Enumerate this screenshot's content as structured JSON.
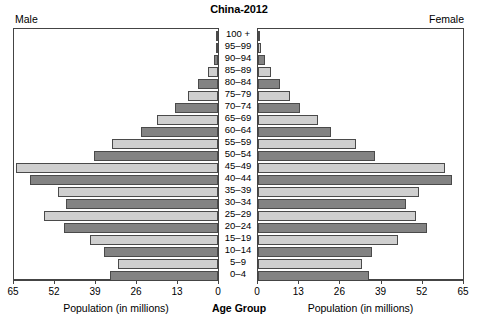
{
  "chart_data": {
    "type": "bar",
    "subtype": "population-pyramid",
    "title": "China-2012",
    "left_panel_label": "Male",
    "right_panel_label": "Female",
    "xlabel_left": "Population (in millions)",
    "xlabel_right": "Population (in millions)",
    "center_axis_label": "Age Group",
    "ylabel": "Age Group",
    "xlim_left": [
      65,
      0
    ],
    "xlim_right": [
      0,
      65
    ],
    "grid": false,
    "legend": "none",
    "left_ticks": [
      "65",
      "52",
      "39",
      "26",
      "13",
      "0"
    ],
    "left_tick_values": [
      65,
      52,
      39,
      26,
      13,
      0
    ],
    "right_ticks": [
      "0",
      "13",
      "26",
      "39",
      "52",
      "65"
    ],
    "right_tick_values": [
      0,
      13,
      26,
      39,
      52,
      65
    ],
    "categories": [
      "100 +",
      "95–99",
      "90–94",
      "85–89",
      "80–84",
      "75–79",
      "70–74",
      "65–69",
      "60–64",
      "55–59",
      "50–54",
      "45–49",
      "40–44",
      "35–39",
      "30–34",
      "25–29",
      "20–24",
      "15–19",
      "10–14",
      "5–9",
      "0–4"
    ],
    "series": [
      {
        "name": "Male",
        "side": "left",
        "values": [
          0.06,
          0.45,
          1.3,
          3.3,
          6.4,
          9.5,
          13.6,
          19.6,
          24.6,
          33.7,
          39.5,
          64.3,
          60.0,
          51.0,
          48.3,
          55.4,
          49.0,
          40.8,
          36.2,
          32.0,
          34.5
        ]
      },
      {
        "name": "Female",
        "side": "right",
        "values": [
          0.1,
          0.8,
          2.2,
          4.1,
          6.9,
          10.0,
          13.4,
          19.0,
          23.0,
          31.1,
          37.0,
          59.4,
          61.4,
          51.2,
          46.8,
          50.0,
          53.5,
          44.5,
          36.0,
          33.0,
          35.2
        ]
      }
    ],
    "colors": {
      "bar_dark": "#838383",
      "bar_light": "#cfcfcf",
      "bar_border": "#4a4a4a",
      "panel_border": "#444444",
      "background": "#ffffff",
      "text": "#000000"
    },
    "bar_shade_pattern": "alternating-dark-light-by-age-group"
  }
}
